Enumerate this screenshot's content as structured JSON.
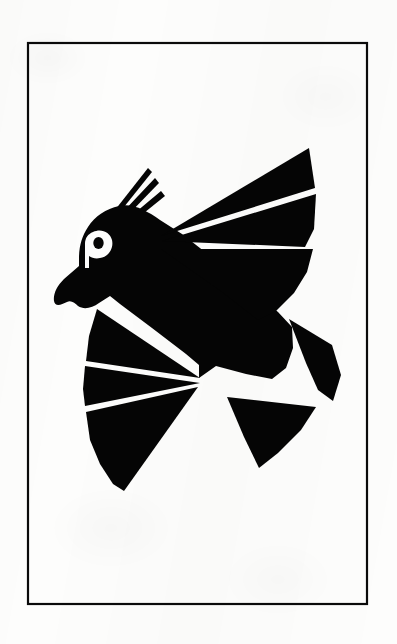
{
  "page": {
    "width": 397,
    "height": 644,
    "background_color": "#fdfdfc",
    "ink_color": "#050505",
    "medium": "scanned line art on white paper",
    "alt_text": "Black angular silhouette of a crested bird in flight enclosed by a thin rectangular border"
  },
  "frame": {
    "name": "rectangular-border",
    "stroke_color": "#0a0a0a",
    "stroke_width": 2,
    "x": 27,
    "y": 42,
    "width": 341,
    "height": 563,
    "fill": "none"
  },
  "artwork": {
    "name": "crested-bird",
    "description": "Stylized angular bird with crest feathers, open beak, two fanned wings and two separate tail feathers",
    "fill_color": "#050505",
    "negative_space_color": "#fdfdfc",
    "parts": [
      {
        "name": "head-and-body",
        "label": "Head, neck and body mass"
      },
      {
        "name": "crest-feather-1",
        "label": "Crest feather (longest, rear)"
      },
      {
        "name": "crest-feather-2",
        "label": "Crest feather (middle)"
      },
      {
        "name": "crest-feather-3",
        "label": "Crest feather (shortest, front)"
      },
      {
        "name": "eye-glyph",
        "label": "Eye rendered as a white letter P / rho glyph"
      },
      {
        "name": "beak",
        "label": "Hooked beak pointing lower-left"
      },
      {
        "name": "upper-wing-feather-1",
        "label": "Upper wing topmost feather"
      },
      {
        "name": "upper-wing-feather-2",
        "label": "Upper wing middle feather"
      },
      {
        "name": "upper-wing-feather-3",
        "label": "Upper wing lower feather"
      },
      {
        "name": "lower-wing-feather-1",
        "label": "Lower wing upper feather"
      },
      {
        "name": "lower-wing-feather-2",
        "label": "Lower wing middle feather"
      },
      {
        "name": "lower-wing-feather-3",
        "label": "Lower wing lowest feather"
      },
      {
        "name": "tail-feather-upper",
        "label": "Detached upper tail feather, right side"
      },
      {
        "name": "tail-feather-lower",
        "label": "Detached lower tail feather, right side"
      }
    ],
    "geometry": {
      "head_body": "M 78 250 L 84 233 L 94 219 L 109 208 L 126 204 L 146 209 L 168 223 L 188 239 L 218 262 L 252 289 L 278 311 L 292 325 L 291 349 L 284 371 L 272 378 L 240 372 L 212 365 L 196 378 L 178 365 L 150 344 L 122 323 L 104 309 L 94 298 L 86 286 L 80 272 Z",
      "beak": "M 80 268 L 62 282 L 54 296 L 56 306 L 68 302 L 76 307 L 92 303 L 104 297 L 92 284 Z",
      "crest_1": "M 120 203 L 146 171 L 118 207 Z",
      "crest_2": "M 126 205 L 152 179 L 124 210 Z",
      "crest_3": "M 132 209 L 158 190 L 130 214 Z",
      "eye": "M 97 237 a 10 11 0 1 1 -0.1 0 M 97 237 l 0 22",
      "upper_wing_1": "M 162 235 L 308 149 L 313 187 Z",
      "upper_wing_2": "M 162 240 L 314 192 L 312 232 L 300 250 Z",
      "upper_wing_3": "M 160 247 L 310 246 L 300 276 L 282 300 L 258 318 L 236 300 Z",
      "lower_wing_1": "M 200 379 L 96 311 L 88 340 L 86 362 Z",
      "lower_wing_2": "M 200 382 L 84 367 L 84 392 L 86 408 Z",
      "lower_wing_3": "M 198 386 L 86 413 L 92 442 L 104 467 L 118 485 Z",
      "tail_upper": "M 288 318 L 330 345 L 338 377 L 330 400 L 312 382 Z",
      "tail_lower": "M 228 398 L 314 408 L 300 432 L 276 456 L 258 468 Z"
    }
  },
  "colors": {
    "ink": "#050505",
    "paper": "#fdfdfc",
    "border": "#0a0a0a"
  }
}
